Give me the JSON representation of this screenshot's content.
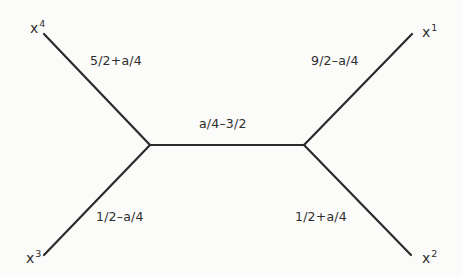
{
  "diagram": {
    "type": "tree-graph",
    "nodes": {
      "x4": {
        "base": "x",
        "sup": "4"
      },
      "x1": {
        "base": "x",
        "sup": "1"
      },
      "x3": {
        "base": "x",
        "sup": "3"
      },
      "x2": {
        "base": "x",
        "sup": "2"
      }
    },
    "edges": {
      "upper_left": {
        "from": "x4",
        "to": "junction_left",
        "label": "5/2+a/4"
      },
      "upper_right": {
        "from": "x1",
        "to": "junction_right",
        "label": "9/2–a/4"
      },
      "lower_left": {
        "from": "x3",
        "to": "junction_left",
        "label": "1/2–a/4"
      },
      "lower_right": {
        "from": "x2",
        "to": "junction_right",
        "label": "1/2+a/4"
      },
      "middle": {
        "from": "junction_left",
        "to": "junction_right",
        "label": "a/4–3/2"
      }
    },
    "colors": {
      "background": "#fbfbf9",
      "line": "#2b2b2b",
      "text": "#2e2e2e"
    }
  }
}
